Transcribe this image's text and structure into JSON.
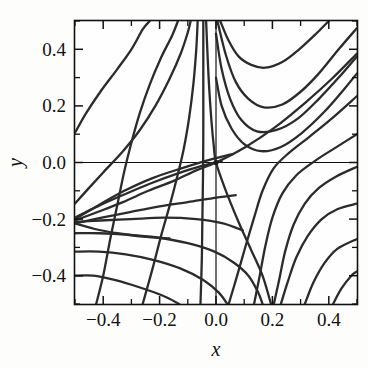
{
  "figure": {
    "background_color": "#fdfdfc",
    "plot_background_color": "#fefefe",
    "frame_color": "#111111",
    "curve_color": "#2b2b2b"
  },
  "chart_data": {
    "type": "line",
    "title": "",
    "subtitle": "",
    "xlabel": "x",
    "ylabel": "y",
    "xlim": [
      -0.5,
      0.5
    ],
    "ylim": [
      -0.5,
      0.5
    ],
    "grid": false,
    "legend": null,
    "legend_position": "none",
    "x_ticks_major": [
      -0.4,
      -0.2,
      0.0,
      0.2,
      0.4
    ],
    "x_ticklabels": [
      "−0.4",
      "−0.2",
      "0.0",
      "0.2",
      "0.4"
    ],
    "x_ticks_minor": [
      -0.5,
      -0.3,
      -0.1,
      0.1,
      0.3,
      0.5
    ],
    "y_ticks_major": [
      -0.4,
      -0.2,
      0.0,
      0.2,
      0.4
    ],
    "y_ticklabels": [
      "−0.4",
      "−0.2",
      "0.0",
      "0.2",
      "0.4"
    ],
    "y_ticks_minor": [
      -0.5,
      -0.3,
      -0.1,
      0.1,
      0.3,
      0.5
    ],
    "zero_lines": {
      "x": 0.0,
      "y": 0.0
    },
    "critical_points": [
      {
        "name": "saddle",
        "x": 0.0,
        "y": 0.0
      },
      {
        "name": "left-node",
        "x": -0.5,
        "y": -0.2
      },
      {
        "name": "bottom-focus",
        "x": 0.2,
        "y": -0.5
      }
    ],
    "series": [
      {
        "name": "ul-1",
        "points": [
          [
            -0.5,
            0.105
          ],
          [
            -0.46,
            0.175
          ],
          [
            -0.41,
            0.25
          ],
          [
            -0.35,
            0.33
          ],
          [
            -0.3,
            0.4
          ],
          [
            -0.26,
            0.47
          ],
          [
            -0.235,
            0.5
          ]
        ]
      },
      {
        "name": "ul-2",
        "points": [
          [
            -0.425,
            -0.5
          ],
          [
            -0.4,
            -0.4
          ],
          [
            -0.375,
            -0.27
          ],
          [
            -0.35,
            -0.15
          ],
          [
            -0.325,
            -0.03
          ],
          [
            -0.3,
            0.07
          ],
          [
            -0.27,
            0.175
          ],
          [
            -0.235,
            0.275
          ],
          [
            -0.195,
            0.37
          ],
          [
            -0.155,
            0.45
          ],
          [
            -0.135,
            0.5
          ]
        ]
      },
      {
        "name": "ul-3",
        "points": [
          [
            -0.5,
            -0.145
          ],
          [
            -0.455,
            -0.095
          ],
          [
            -0.4,
            -0.035
          ],
          [
            -0.33,
            0.04
          ],
          [
            -0.27,
            0.115
          ],
          [
            -0.215,
            0.2
          ],
          [
            -0.165,
            0.295
          ],
          [
            -0.125,
            0.385
          ],
          [
            -0.1,
            0.46
          ],
          [
            -0.09,
            0.5
          ]
        ]
      },
      {
        "name": "ul-4",
        "points": [
          [
            -0.26,
            -0.5
          ],
          [
            -0.225,
            -0.375
          ],
          [
            -0.195,
            -0.26
          ],
          [
            -0.165,
            -0.155
          ],
          [
            -0.14,
            -0.06
          ],
          [
            -0.115,
            0.045
          ],
          [
            -0.095,
            0.16
          ],
          [
            -0.08,
            0.28
          ],
          [
            -0.07,
            0.4
          ],
          [
            -0.065,
            0.5
          ]
        ]
      },
      {
        "name": "ul-5",
        "points": [
          [
            -0.055,
            -0.5
          ],
          [
            -0.05,
            -0.33
          ],
          [
            -0.048,
            -0.18
          ],
          [
            -0.046,
            -0.04
          ],
          [
            -0.045,
            0.12
          ],
          [
            -0.045,
            0.28
          ],
          [
            -0.045,
            0.4
          ],
          [
            -0.045,
            0.5
          ]
        ]
      },
      {
        "name": "sep-steep",
        "points": [
          [
            -0.035,
            0.5
          ],
          [
            -0.03,
            0.38
          ],
          [
            -0.024,
            0.26
          ],
          [
            -0.016,
            0.145
          ],
          [
            -0.008,
            0.06
          ],
          [
            0.0,
            0.0
          ],
          [
            0.035,
            -0.1
          ],
          [
            0.08,
            -0.21
          ],
          [
            0.125,
            -0.31
          ],
          [
            0.165,
            -0.4
          ],
          [
            0.195,
            -0.5
          ]
        ]
      },
      {
        "name": "sep-shallow",
        "points": [
          [
            -0.5,
            -0.205
          ],
          [
            -0.42,
            -0.175
          ],
          [
            -0.33,
            -0.14
          ],
          [
            -0.24,
            -0.1
          ],
          [
            -0.15,
            -0.065
          ],
          [
            -0.07,
            -0.028
          ],
          [
            0.0,
            0.0
          ],
          [
            0.105,
            0.055
          ],
          [
            0.21,
            0.125
          ],
          [
            0.315,
            0.21
          ],
          [
            0.41,
            0.295
          ],
          [
            0.5,
            0.385
          ]
        ]
      },
      {
        "name": "ur-1",
        "points": [
          [
            0.015,
            0.5
          ],
          [
            0.045,
            0.43
          ],
          [
            0.08,
            0.375
          ],
          [
            0.125,
            0.345
          ],
          [
            0.175,
            0.335
          ],
          [
            0.235,
            0.355
          ],
          [
            0.295,
            0.4
          ],
          [
            0.355,
            0.455
          ],
          [
            0.4,
            0.5
          ]
        ]
      },
      {
        "name": "ur-2",
        "points": [
          [
            0.005,
            0.5
          ],
          [
            0.035,
            0.38
          ],
          [
            0.07,
            0.285
          ],
          [
            0.115,
            0.225
          ],
          [
            0.17,
            0.195
          ],
          [
            0.235,
            0.205
          ],
          [
            0.3,
            0.25
          ],
          [
            0.365,
            0.315
          ],
          [
            0.435,
            0.4
          ],
          [
            0.5,
            0.475
          ]
        ]
      },
      {
        "name": "ur-3",
        "points": [
          [
            0.0,
            0.455
          ],
          [
            0.02,
            0.33
          ],
          [
            0.05,
            0.225
          ],
          [
            0.09,
            0.15
          ],
          [
            0.145,
            0.11
          ],
          [
            0.215,
            0.115
          ],
          [
            0.29,
            0.155
          ],
          [
            0.365,
            0.225
          ],
          [
            0.435,
            0.3
          ],
          [
            0.5,
            0.375
          ]
        ]
      },
      {
        "name": "ur-4",
        "points": [
          [
            0.0,
            0.3
          ],
          [
            0.02,
            0.2
          ],
          [
            0.055,
            0.12
          ],
          [
            0.1,
            0.065
          ],
          [
            0.16,
            0.04
          ],
          [
            0.23,
            0.055
          ],
          [
            0.305,
            0.105
          ],
          [
            0.385,
            0.18
          ],
          [
            0.455,
            0.26
          ],
          [
            0.5,
            0.315
          ]
        ]
      },
      {
        "name": "r-1",
        "points": [
          [
            0.045,
            -0.5
          ],
          [
            0.075,
            -0.4
          ],
          [
            0.105,
            -0.295
          ],
          [
            0.135,
            -0.195
          ],
          [
            0.165,
            -0.1
          ],
          [
            0.205,
            -0.02
          ],
          [
            0.26,
            0.035
          ],
          [
            0.33,
            0.09
          ],
          [
            0.41,
            0.155
          ],
          [
            0.5,
            0.235
          ]
        ]
      },
      {
        "name": "r-2",
        "points": [
          [
            0.135,
            -0.5
          ],
          [
            0.155,
            -0.4
          ],
          [
            0.175,
            -0.295
          ],
          [
            0.2,
            -0.195
          ],
          [
            0.235,
            -0.11
          ],
          [
            0.285,
            -0.045
          ],
          [
            0.35,
            0.005
          ],
          [
            0.42,
            0.05
          ],
          [
            0.5,
            0.1
          ]
        ]
      },
      {
        "name": "r-3",
        "points": [
          [
            0.205,
            -0.5
          ],
          [
            0.225,
            -0.41
          ],
          [
            0.245,
            -0.315
          ],
          [
            0.275,
            -0.22
          ],
          [
            0.315,
            -0.145
          ],
          [
            0.365,
            -0.09
          ],
          [
            0.425,
            -0.05
          ],
          [
            0.5,
            -0.015
          ]
        ]
      },
      {
        "name": "r-4",
        "points": [
          [
            0.23,
            -0.5
          ],
          [
            0.255,
            -0.42
          ],
          [
            0.285,
            -0.335
          ],
          [
            0.325,
            -0.26
          ],
          [
            0.375,
            -0.2
          ],
          [
            0.43,
            -0.165
          ],
          [
            0.5,
            -0.145
          ]
        ]
      },
      {
        "name": "r-5",
        "points": [
          [
            0.315,
            -0.5
          ],
          [
            0.345,
            -0.425
          ],
          [
            0.385,
            -0.355
          ],
          [
            0.43,
            -0.305
          ],
          [
            0.5,
            -0.27
          ]
        ]
      },
      {
        "name": "r-6",
        "points": [
          [
            0.415,
            -0.5
          ],
          [
            0.445,
            -0.445
          ],
          [
            0.48,
            -0.4
          ],
          [
            0.5,
            -0.385
          ]
        ]
      },
      {
        "name": "ll-1",
        "points": [
          [
            -0.5,
            -0.195
          ],
          [
            -0.42,
            -0.155
          ],
          [
            -0.33,
            -0.115
          ],
          [
            -0.235,
            -0.075
          ],
          [
            -0.14,
            -0.04
          ],
          [
            -0.05,
            -0.012
          ],
          [
            0.02,
            0.005
          ]
        ]
      },
      {
        "name": "ll-2",
        "points": [
          [
            -0.5,
            -0.215
          ],
          [
            -0.405,
            -0.195
          ],
          [
            -0.305,
            -0.175
          ],
          [
            -0.2,
            -0.155
          ],
          [
            -0.1,
            -0.14
          ],
          [
            -0.005,
            -0.125
          ],
          [
            0.07,
            -0.115
          ]
        ]
      },
      {
        "name": "ll-3",
        "points": [
          [
            -0.5,
            -0.2
          ],
          [
            -0.415,
            -0.15
          ],
          [
            -0.325,
            -0.1
          ],
          [
            -0.225,
            -0.055
          ],
          [
            -0.12,
            -0.02
          ],
          [
            -0.02,
            0.01
          ],
          [
            0.06,
            0.03
          ]
        ]
      },
      {
        "name": "ll-4",
        "points": [
          [
            -0.5,
            -0.21
          ],
          [
            -0.41,
            -0.205
          ],
          [
            -0.3,
            -0.2
          ],
          [
            -0.185,
            -0.195
          ],
          [
            -0.07,
            -0.2
          ],
          [
            0.025,
            -0.215
          ],
          [
            0.095,
            -0.24
          ]
        ]
      },
      {
        "name": "ll-5",
        "points": [
          [
            -0.5,
            -0.25
          ],
          [
            -0.415,
            -0.25
          ],
          [
            -0.315,
            -0.255
          ],
          [
            -0.21,
            -0.265
          ],
          [
            -0.1,
            -0.285
          ],
          [
            -0.005,
            -0.315
          ],
          [
            0.065,
            -0.355
          ],
          [
            0.115,
            -0.4
          ],
          [
            0.15,
            -0.46
          ],
          [
            0.165,
            -0.5
          ]
        ]
      },
      {
        "name": "ll-6",
        "points": [
          [
            -0.5,
            -0.315
          ],
          [
            -0.415,
            -0.315
          ],
          [
            -0.32,
            -0.325
          ],
          [
            -0.22,
            -0.345
          ],
          [
            -0.125,
            -0.375
          ],
          [
            -0.045,
            -0.415
          ],
          [
            0.01,
            -0.46
          ],
          [
            0.04,
            -0.5
          ]
        ]
      },
      {
        "name": "ll-7",
        "points": [
          [
            -0.5,
            -0.4
          ],
          [
            -0.435,
            -0.4
          ],
          [
            -0.36,
            -0.415
          ],
          [
            -0.275,
            -0.44
          ],
          [
            -0.19,
            -0.47
          ],
          [
            -0.13,
            -0.5
          ]
        ]
      },
      {
        "name": "ll-8",
        "points": [
          [
            -0.5,
            -0.215
          ],
          [
            -0.43,
            -0.235
          ],
          [
            -0.35,
            -0.25
          ],
          [
            -0.26,
            -0.262
          ],
          [
            -0.165,
            -0.268
          ]
        ]
      }
    ]
  },
  "axes": {
    "x_label": "x",
    "y_label": "y"
  }
}
